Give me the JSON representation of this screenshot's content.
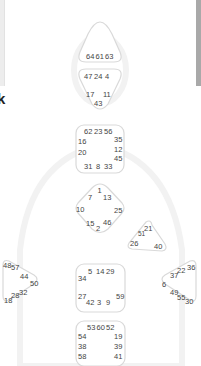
{
  "left_panel": {
    "partial_text_1": "k",
    "partial_text_2": ","
  },
  "colors": {
    "center_stroke": "#d9d9d9",
    "gate_text": "#444444",
    "scrollbar": "#a9a9a9",
    "silhouette": "#f2f2f2"
  },
  "bodygraph": {
    "head": {
      "gates": [
        "64",
        "61",
        "63"
      ]
    },
    "ajna": {
      "top": [
        "47",
        "24",
        "4"
      ],
      "mid_left": "17",
      "mid_right": "11",
      "bottom": "43"
    },
    "throat": {
      "top": [
        "62",
        "23",
        "56"
      ],
      "left": [
        "16",
        "20"
      ],
      "right": [
        "35",
        "12",
        "45"
      ],
      "bottom": [
        "31",
        "8",
        "33"
      ]
    },
    "g_center": {
      "top": "1",
      "upper_left": "7",
      "upper_right": "13",
      "left": "10",
      "right": "25",
      "lower_left": "15",
      "lower_right": "46",
      "bottom": "2"
    },
    "heart": {
      "gates": [
        "21",
        "51",
        "26",
        "40"
      ]
    },
    "spleen": {
      "gates": [
        "48",
        "57",
        "44",
        "50",
        "32",
        "28",
        "18"
      ]
    },
    "solar_plexus": {
      "gates": [
        "36",
        "22",
        "37",
        "6",
        "49",
        "55",
        "30"
      ]
    },
    "sacral": {
      "top": [
        "5",
        "14",
        "29"
      ],
      "left": [
        "34",
        "27"
      ],
      "right": "59",
      "bottom": [
        "42",
        "3",
        "9"
      ]
    },
    "root": {
      "top": [
        "53",
        "60",
        "52"
      ],
      "left": [
        "54",
        "38",
        "58"
      ],
      "right": [
        "19",
        "39",
        "41"
      ]
    }
  }
}
